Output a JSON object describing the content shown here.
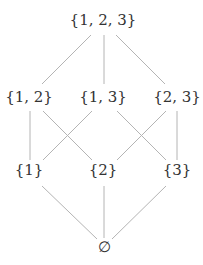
{
  "diagram": {
    "type": "hasse-diagram",
    "nodes": [
      {
        "id": "n123",
        "label": "{1, 2, 3}"
      },
      {
        "id": "n12",
        "label": "{1, 2}"
      },
      {
        "id": "n13",
        "label": "{1, 3}"
      },
      {
        "id": "n23",
        "label": "{2, 3}"
      },
      {
        "id": "n1",
        "label": "{1}"
      },
      {
        "id": "n2",
        "label": "{2}"
      },
      {
        "id": "n3",
        "label": "{3}"
      },
      {
        "id": "n0",
        "label": "∅"
      }
    ],
    "edges": [
      {
        "from": "n123",
        "to": "n12"
      },
      {
        "from": "n123",
        "to": "n13"
      },
      {
        "from": "n123",
        "to": "n23"
      },
      {
        "from": "n12",
        "to": "n1"
      },
      {
        "from": "n12",
        "to": "n2"
      },
      {
        "from": "n13",
        "to": "n1"
      },
      {
        "from": "n13",
        "to": "n3"
      },
      {
        "from": "n23",
        "to": "n2"
      },
      {
        "from": "n23",
        "to": "n3"
      },
      {
        "from": "n1",
        "to": "n0"
      },
      {
        "from": "n2",
        "to": "n0"
      },
      {
        "from": "n3",
        "to": "n0"
      }
    ]
  }
}
